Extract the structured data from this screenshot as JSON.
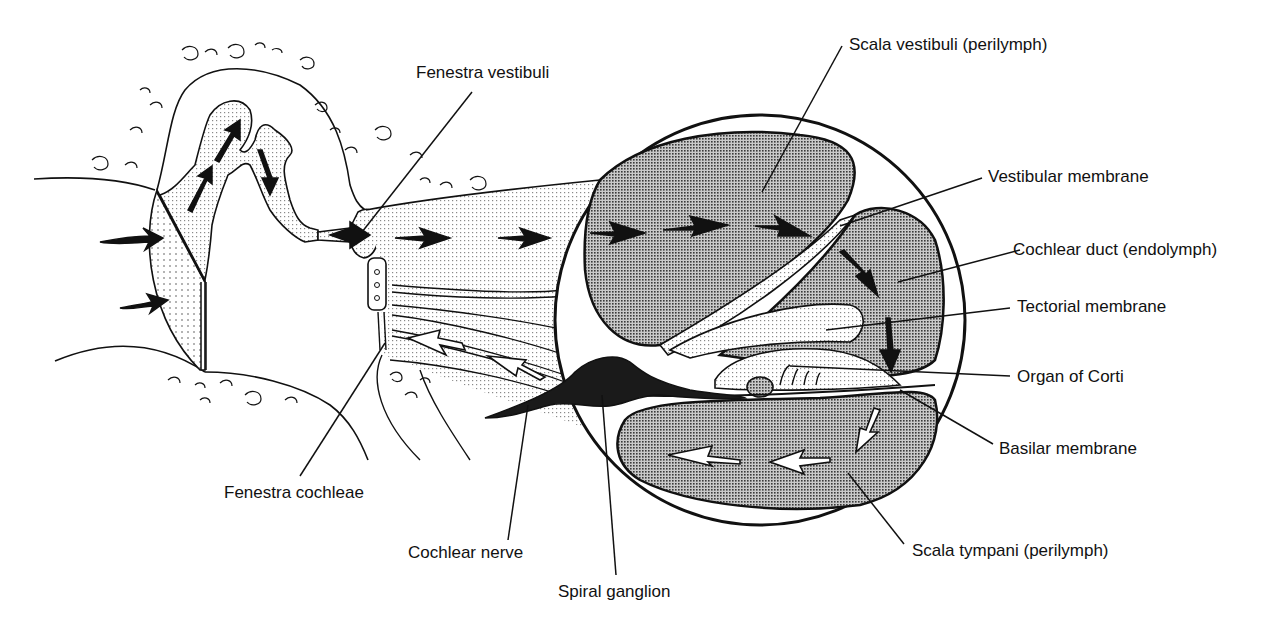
{
  "diagram": {
    "colors": {
      "ink": "#111111",
      "dense_stipple": "#9a9a9a",
      "light_stipple": "#d8d8d8",
      "background": "#ffffff"
    },
    "labels": [
      {
        "id": "fenestra-vestibuli",
        "text": "Fenestra vestibuli"
      },
      {
        "id": "scala-vestibuli",
        "text": "Scala vestibuli (perilymph)"
      },
      {
        "id": "vestibular-membrane",
        "text": "Vestibular membrane"
      },
      {
        "id": "cochlear-duct",
        "text": "Cochlear duct (endolymph)"
      },
      {
        "id": "tectorial-membrane",
        "text": "Tectorial membrane"
      },
      {
        "id": "organ-of-corti",
        "text": "Organ of Corti"
      },
      {
        "id": "basilar-membrane",
        "text": "Basilar membrane"
      },
      {
        "id": "fenestra-cochleae",
        "text": "Fenestra cochleae"
      },
      {
        "id": "cochlear-nerve",
        "text": "Cochlear nerve"
      },
      {
        "id": "spiral-ganglion",
        "text": "Spiral ganglion"
      },
      {
        "id": "scala-tympani",
        "text": "Scala tympani (perilymph)"
      }
    ],
    "structures": {
      "left": [
        "tympanic membrane",
        "ossicles (malleus, incus, stapes)",
        "middle ear cavity"
      ],
      "center": [
        "uncoiled cochlear canal with perilymph flow"
      ],
      "right": [
        "cochlear cross-section"
      ]
    },
    "arrows": {
      "incoming_sound": 2,
      "ossicle_motion": 3,
      "scala_vestibuli_flow": 5,
      "cochlear_duct_flow": 2,
      "scala_tympani_return": 5
    }
  }
}
